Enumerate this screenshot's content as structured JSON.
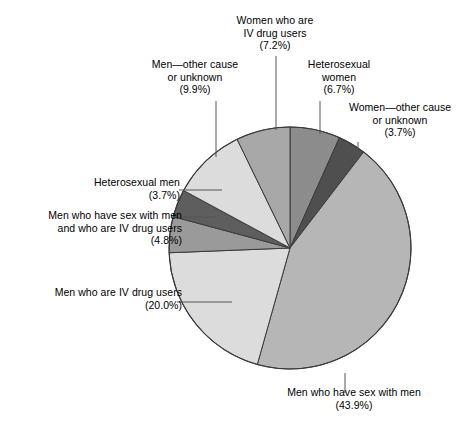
{
  "chart_data": {
    "type": "pie",
    "title": "",
    "subtitle": "",
    "xlabel": "",
    "ylabel": "",
    "legend_position": "none (direct labels with leader lines)",
    "grid": false,
    "units": "percent",
    "start_angle_deg": 0,
    "direction": "clockwise",
    "categories": [
      "Heterosexual women",
      "Women—other cause or unknown",
      "Men who have sex with men",
      "Men who are IV drug users",
      "Men who have sex with men and who are IV drug users",
      "Heterosexual men",
      "Men—other cause or unknown",
      "Women who are IV drug users"
    ],
    "values": [
      6.7,
      3.7,
      43.9,
      20.0,
      4.8,
      3.7,
      9.9,
      7.2
    ],
    "colors": [
      "#8c8c8c",
      "#4f4f4f",
      "#b6b6b6",
      "#dcdcdc",
      "#9a9a9a",
      "#5e5e5e",
      "#dcdcdc",
      "#a8a8a8"
    ],
    "slices": [
      {
        "label": "Heterosexual women",
        "value": 6.7,
        "value_text": "(6.7%)",
        "color": "#8c8c8c"
      },
      {
        "label": "Women—other cause or unknown",
        "value": 3.7,
        "value_text": "(3.7%)",
        "color": "#4f4f4f"
      },
      {
        "label": "Men who have sex with men",
        "value": 43.9,
        "value_text": "(43.9%)",
        "color": "#b6b6b6"
      },
      {
        "label": "Men who are IV drug users",
        "value": 20.0,
        "value_text": "(20.0%)",
        "color": "#dcdcdc"
      },
      {
        "label": "Men who have sex with men and who are IV drug users",
        "value": 4.8,
        "value_text": "(4.8%)",
        "color": "#9a9a9a"
      },
      {
        "label": "Heterosexual men",
        "value": 3.7,
        "value_text": "(3.7%)",
        "color": "#5e5e5e"
      },
      {
        "label": "Men—other cause or unknown",
        "value": 9.9,
        "value_text": "(9.9%)",
        "color": "#dcdcdc"
      },
      {
        "label": "Women who are IV drug users",
        "value": 7.2,
        "value_text": "(7.2%)",
        "color": "#a8a8a8"
      }
    ]
  },
  "labels": {
    "women_ivdu": "Women who are\nIV drug users\n(7.2%)",
    "men_other": "Men—other cause\nor unknown\n(9.9%)",
    "het_women": "Heterosexual\nwomen\n(6.7%)",
    "women_other": "Women—other cause\nor unknown\n(3.7%)",
    "het_men": "Heterosexual men\n(3.7%)",
    "msm_ivdu": "Men who have sex with men\nand who are IV drug users\n(4.8%)",
    "men_ivdu": "Men who are IV drug users\n(20.0%)",
    "msm": "Men who have sex with men\n(43.9%)"
  },
  "style": {
    "background": "#ffffff",
    "outline": "#3a3a3a",
    "leader_line": "#555555",
    "text": "#000000"
  }
}
